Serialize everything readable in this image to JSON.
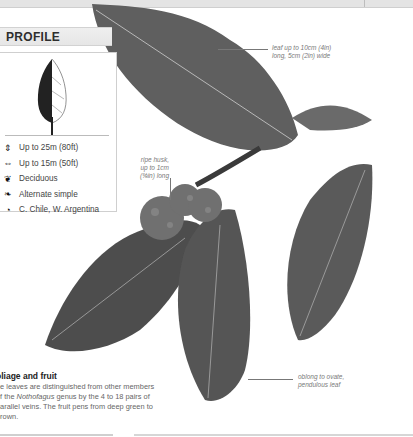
{
  "header": {
    "section_title": "PROFILE"
  },
  "profile": {
    "facts": [
      {
        "icon": "height-icon",
        "glyph": "⇕",
        "text": "Up to 25m (80ft)"
      },
      {
        "icon": "spread-icon",
        "glyph": "⇔",
        "text": "Up to 15m (50ft)"
      },
      {
        "icon": "deciduous-leaf-icon",
        "glyph": "❦",
        "text": "Deciduous"
      },
      {
        "icon": "leaf-type-icon",
        "glyph": "❧",
        "text": "Alternate simple"
      },
      {
        "icon": "globe-icon",
        "glyph": "◔",
        "text": "C. Chile, W. Argentina"
      }
    ]
  },
  "annotations": {
    "leaf_size": [
      "leaf up to 10cm (4in)",
      "long, 5cm (2in) wide"
    ],
    "husk": [
      "ripe husk,",
      "up to 1cm",
      "(⅜in) long"
    ],
    "leaf_shape": [
      "oblong to ovate,",
      "pendulous leaf"
    ]
  },
  "foliage": {
    "title": "oliage and fruit",
    "body_pre": "he leaves are distinguished from other members of the ",
    "genus": "Nothofagus",
    "body_post": " genus by the 4 to 18 pairs of parallel veins. The fruit pens from deep green to brown."
  },
  "colors": {
    "leaf": "#5a5a5a",
    "leaf_dark": "#3a3a3a",
    "vein": "#b8b8b8",
    "header_bg": "#e8e8e8"
  }
}
